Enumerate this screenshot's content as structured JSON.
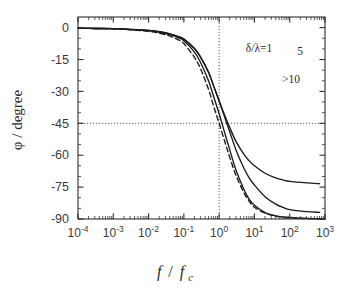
{
  "chart_data": {
    "type": "line",
    "title": "",
    "xlabel": "f / f_c",
    "ylabel": "φ / degree",
    "xscale": "log",
    "xlim": [
      0.0001,
      1000
    ],
    "ylim": [
      -90,
      5
    ],
    "grid": false,
    "x_tick_labels": [
      "10⁻⁴",
      "10⁻³",
      "10⁻²",
      "10⁻¹",
      "10⁰",
      "10¹",
      "10²",
      "10³"
    ],
    "x_tick_mantissa": [
      "10",
      "10",
      "10",
      "10",
      "10",
      "10",
      "10",
      "10"
    ],
    "x_tick_exponents": [
      "-4",
      "-3",
      "-2",
      "-1",
      "0",
      "1",
      "2",
      "3"
    ],
    "x_tick_values": [
      0.0001,
      0.001,
      0.01,
      0.1,
      1,
      10,
      100,
      1000
    ],
    "y_tick_labels": [
      "-90",
      "-75",
      "-60",
      "-45",
      "-30",
      "-15",
      "0"
    ],
    "y_tick_values": [
      -90,
      -75,
      -60,
      -45,
      -30,
      -15,
      0
    ],
    "reference_lines": [
      {
        "name": "phi-minus-45-guide",
        "orientation": "horizontal",
        "value": -45,
        "style": "dotted"
      },
      {
        "name": "f-over-fc-unity-guide",
        "orientation": "vertical",
        "value": 1,
        "style": "dotted"
      }
    ],
    "annotations": [
      {
        "name": "curve-label-delta-lambda-1",
        "text": "δ/λ=1",
        "x": 259,
        "y": 52
      },
      {
        "name": "curve-label-5",
        "text": "5",
        "x": 300,
        "y": 55
      },
      {
        "name": "curve-label-gt-10",
        "text": ">10",
        "x": 291,
        "y": 83
      }
    ],
    "series": [
      {
        "name": "ideal-dashed",
        "label": "",
        "style": "dashed",
        "color": "#1a1a1a",
        "x": [
          0.0001,
          0.0003,
          0.001,
          0.003,
          0.01,
          0.02,
          0.04,
          0.07,
          0.1,
          0.2,
          0.3,
          0.5,
          0.7,
          1,
          1.5,
          2,
          3,
          5,
          7,
          10,
          20,
          40,
          70,
          100,
          300,
          1000
        ],
        "y": [
          -0.3,
          -0.4,
          -0.6,
          -1.0,
          -1.8,
          -2.6,
          -4.0,
          -5.8,
          -7.5,
          -14.0,
          -19.5,
          -29.0,
          -37.0,
          -45.0,
          -54.5,
          -61.0,
          -69.5,
          -77.5,
          -81.5,
          -84.5,
          -87.2,
          -88.6,
          -89.2,
          -89.4,
          -89.8,
          -90.0
        ]
      },
      {
        "name": "delta-lambda-1",
        "label": "δ/λ=1",
        "style": "solid",
        "color": "#1a1a1a",
        "x": [
          0.0001,
          0.0003,
          0.001,
          0.003,
          0.01,
          0.02,
          0.04,
          0.07,
          0.1,
          0.2,
          0.3,
          0.5,
          0.7,
          1,
          1.5,
          2,
          3,
          5,
          7,
          10,
          20,
          40,
          70,
          100,
          300,
          1000
        ],
        "y": [
          -0.3,
          -0.4,
          -0.5,
          -0.9,
          -1.5,
          -2.2,
          -3.3,
          -4.8,
          -6.2,
          -11.5,
          -16.5,
          -25.0,
          -32.5,
          -40.5,
          -50.5,
          -57.5,
          -67.0,
          -76.0,
          -80.5,
          -83.5,
          -87.0,
          -88.5,
          -89.1,
          -89.3,
          -89.7,
          -90.0
        ]
      },
      {
        "name": "delta-lambda-5",
        "label": "5",
        "style": "solid",
        "color": "#1a1a1a",
        "x": [
          0.0001,
          0.0003,
          0.001,
          0.003,
          0.01,
          0.02,
          0.04,
          0.07,
          0.1,
          0.2,
          0.3,
          0.5,
          0.7,
          1,
          1.5,
          2,
          3,
          5,
          7,
          10,
          20,
          40,
          70,
          100,
          300,
          700
        ],
        "y": [
          -0.3,
          -0.4,
          -0.5,
          -0.8,
          -1.3,
          -1.9,
          -2.9,
          -4.2,
          -5.4,
          -9.8,
          -14.0,
          -21.0,
          -27.5,
          -34.5,
          -43.0,
          -49.0,
          -57.5,
          -66.0,
          -70.5,
          -74.0,
          -79.5,
          -83.0,
          -84.8,
          -85.6,
          -86.5,
          -86.9
        ]
      },
      {
        "name": "delta-lambda-gt-10",
        "label": ">10",
        "style": "solid",
        "color": "#1a1a1a",
        "x": [
          0.0001,
          0.0003,
          0.001,
          0.003,
          0.01,
          0.02,
          0.04,
          0.07,
          0.1,
          0.2,
          0.3,
          0.5,
          0.7,
          1,
          1.5,
          2,
          3,
          5,
          7,
          10,
          20,
          40,
          70,
          100,
          300,
          700
        ],
        "y": [
          -0.3,
          -0.4,
          -0.5,
          -0.8,
          -1.3,
          -1.9,
          -2.9,
          -4.2,
          -5.4,
          -9.8,
          -14.0,
          -21.0,
          -27.5,
          -34.5,
          -42.0,
          -47.0,
          -53.5,
          -59.5,
          -62.5,
          -65.0,
          -68.5,
          -70.7,
          -71.8,
          -72.3,
          -73.0,
          -73.4
        ]
      }
    ]
  },
  "figure": {
    "axis_color": "#2e2e2e",
    "curve_color": "#1a1a1a",
    "guide_color": "#4a4a4a",
    "background": "#ffffff"
  }
}
